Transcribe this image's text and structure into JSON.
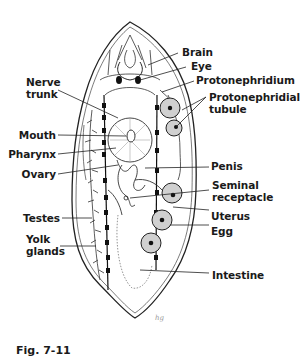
{
  "figure": {
    "caption": "Fig. 7-11",
    "artist_mark": "hg",
    "labels_left": [
      {
        "id": "nerve-trunk",
        "line1": "Nerve",
        "line2": "trunk"
      },
      {
        "id": "mouth",
        "line1": "Mouth"
      },
      {
        "id": "pharynx",
        "line1": "Pharynx"
      },
      {
        "id": "ovary",
        "line1": "Ovary"
      },
      {
        "id": "testes",
        "line1": "Testes"
      },
      {
        "id": "yolk-glands",
        "line1": "Yolk",
        "line2": "glands"
      }
    ],
    "labels_right": [
      {
        "id": "brain",
        "line1": "Brain"
      },
      {
        "id": "eye",
        "line1": "Eye"
      },
      {
        "id": "protonephridium",
        "line1": "Protonephridium"
      },
      {
        "id": "protonephridial-tubule",
        "line1": "Protonephridial",
        "line2": "tubule"
      },
      {
        "id": "penis",
        "line1": "Penis"
      },
      {
        "id": "seminal-receptacle",
        "line1": "Seminal",
        "line2": "receptacle"
      },
      {
        "id": "uterus",
        "line1": "Uterus"
      },
      {
        "id": "egg",
        "line1": "Egg"
      },
      {
        "id": "intestine",
        "line1": "Intestine"
      }
    ],
    "colors": {
      "ink": "#1a1a1a",
      "egg_fill": "#bdbdbd",
      "paper": "#ffffff"
    }
  }
}
